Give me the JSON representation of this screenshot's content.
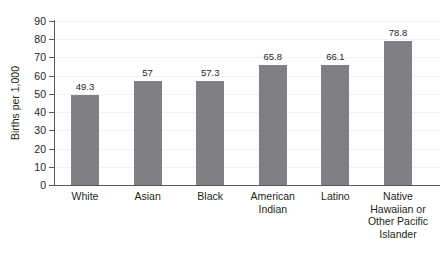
{
  "chart_data": {
    "type": "bar",
    "title": "",
    "subtitle": "",
    "xlabel": "",
    "ylabel": "Births per 1,000",
    "ylim": [
      0,
      90
    ],
    "ytick_step": 10,
    "yticks": [
      "90",
      "80",
      "70",
      "60",
      "50",
      "40",
      "30",
      "20",
      "10",
      "0"
    ],
    "grid": true,
    "grid_axis": "y",
    "legend": false,
    "legend_position": "none",
    "bar_color": "#7f8083",
    "axis_color": "#58595b",
    "gridline_color": "#f0f1f2",
    "text_color": "#231f20",
    "background": "#ffffff",
    "categories": [
      "White",
      "Asian",
      "Black",
      "American Indian",
      "Latino",
      "Native Hawaiian or Other Pacific Islander"
    ],
    "category_lines": [
      [
        "White"
      ],
      [
        "Asian"
      ],
      [
        "Black"
      ],
      [
        "American",
        "Indian"
      ],
      [
        "Latino"
      ],
      [
        "Native",
        "Hawaiian or",
        "Other Pacific",
        "Islander"
      ]
    ],
    "values": [
      49.3,
      57,
      57.3,
      65.8,
      66.1,
      78.8
    ],
    "value_labels": [
      "49.3",
      "57",
      "57.3",
      "65.8",
      "66.1",
      "78.8"
    ]
  }
}
